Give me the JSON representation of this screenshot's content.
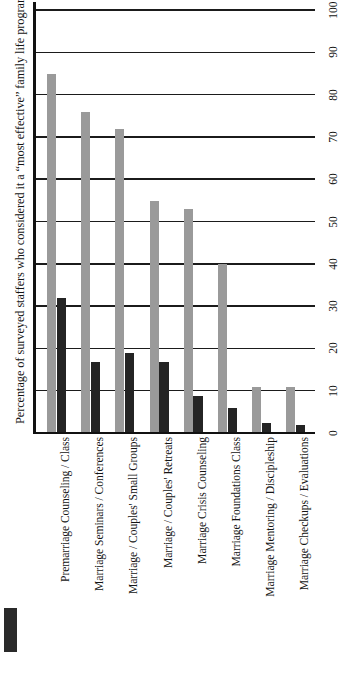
{
  "chart_data": {
    "type": "bar",
    "title": "",
    "xlabel": "",
    "ylabel": "Percentage of surveyed staffers who considered it a “most effective” family life program",
    "ylim": [
      0,
      100
    ],
    "yticks": [
      0,
      10,
      20,
      30,
      40,
      50,
      60,
      70,
      80,
      90,
      100
    ],
    "grid": true,
    "legend_position": "bottom-left",
    "orientation": "vertical",
    "categories": [
      "Premarriage Counseling / Class",
      "Marriage Seminars / Conferences",
      "Marriage / Couples' Small Groups",
      "Marriage / Couples' Retreats",
      "Marriage Crisis Counseling",
      "Marriage Foundations Class",
      "Marriage Mentoring / Discipleship",
      "Marriage Checkups / Evaluations"
    ],
    "series": [
      {
        "name": "Offered",
        "color": "#9a9a9a",
        "values": [
          85,
          76,
          72,
          55,
          53,
          40,
          11,
          11
        ]
      },
      {
        "name": "Most effective",
        "color": "#242424",
        "values": [
          32,
          17,
          19,
          17,
          9,
          6,
          2.5,
          2
        ]
      }
    ]
  },
  "axis": {
    "y_title": "Percentage of surveyed staffers who considered it a “most effective” family life program",
    "tick_labels": [
      "0",
      "10",
      "20",
      "30",
      "40",
      "50",
      "60",
      "70",
      "80",
      "90",
      "100"
    ]
  },
  "legend": {
    "swatch_color": "#242424",
    "swatch_name": "legend-swatch-dark"
  }
}
